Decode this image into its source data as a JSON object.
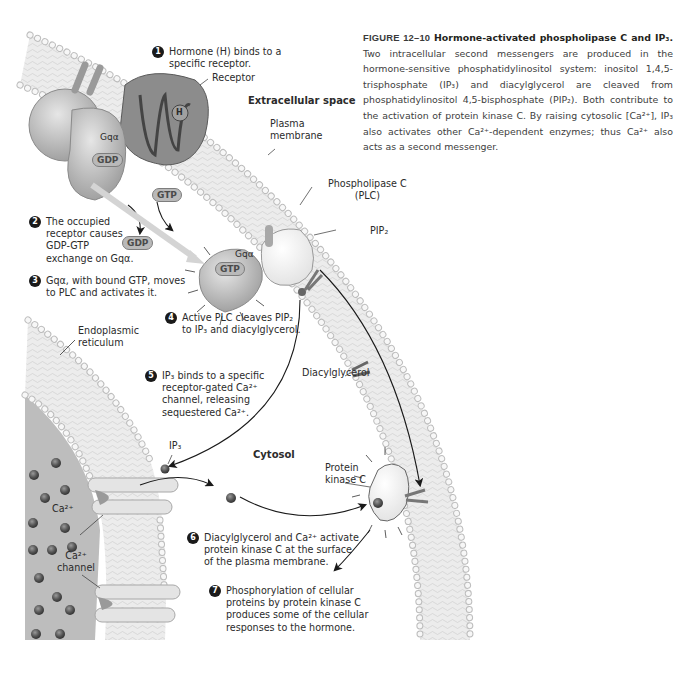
{
  "page_header": "",
  "caption": {
    "figure_label": "FIGURE 12–10",
    "title": "Hormone-activated phospholipase C and IP₃.",
    "body": "Two intracellular second messengers are produced in the hormone-sensitive phosphatidylinositol system: inositol 1,4,5-trisphosphate (IP₃) and diacylglycerol are cleaved from phosphatidylinositol 4,5-bisphosphate (PIP₂). Both contribute to the activation of protein kinase C. By raising cytosolic [Ca²⁺], IP₃ also activates other Ca²⁺-dependent enzymes; thus Ca²⁺ also acts as a second messenger."
  },
  "regions": {
    "extracellular": "Extracellular space",
    "cytosol": "Cytosol"
  },
  "labels": {
    "receptor": "Receptor",
    "plasma_membrane": "Plasma\nmembrane",
    "plc": "Phospholipase C\n(PLC)",
    "pip2": "PIP₂",
    "er": "Endoplasmic\nreticulum",
    "diacylglycerol": "Diacylglycerol",
    "ip3": "IP₃",
    "ca": "Ca²⁺",
    "ca_channel": "Ca²⁺\nchannel",
    "pkc": "Protein\nkinase C",
    "gq_inactive": "Gqα",
    "gq_active": "Gqα",
    "hormone": "H"
  },
  "chips": {
    "gdp_bound": "GDP",
    "gtp_free": "GTP",
    "gdp_released": "GDP",
    "gtp_bound": "GTP"
  },
  "steps": [
    {
      "num": "1",
      "text": "Hormone (H) binds to a\nspecific receptor."
    },
    {
      "num": "2",
      "text": "The occupied\nreceptor causes\nGDP-GTP\nexchange on Gqα."
    },
    {
      "num": "3",
      "text": "Gqα, with bound GTP, moves\nto PLC and activates it."
    },
    {
      "num": "4",
      "text": "Active PLC cleaves PIP₂\nto IP₃ and diacylglycerol."
    },
    {
      "num": "5",
      "text": "IP₃ binds to a specific\nreceptor-gated Ca²⁺\nchannel, releasing\nsequestered Ca²⁺."
    },
    {
      "num": "6",
      "text": "Diacylglycerol and Ca²⁺ activate\nprotein kinase C at the surface\nof the plasma membrane."
    },
    {
      "num": "7",
      "text": "Phosphorylation of cellular\nproteins by protein kinase C\nproduces some of the cellular\nresponses to the hormone."
    }
  ],
  "colors": {
    "membrane_fill": "#ececec",
    "head_group": "#f4f4f4",
    "protein_gray": "#b3b3b3",
    "receptor_dark": "#6e6e6e",
    "er_lumen": "#bdbdbd",
    "ca_ion": "#5a5a5a",
    "text": "#2b2b2b"
  }
}
